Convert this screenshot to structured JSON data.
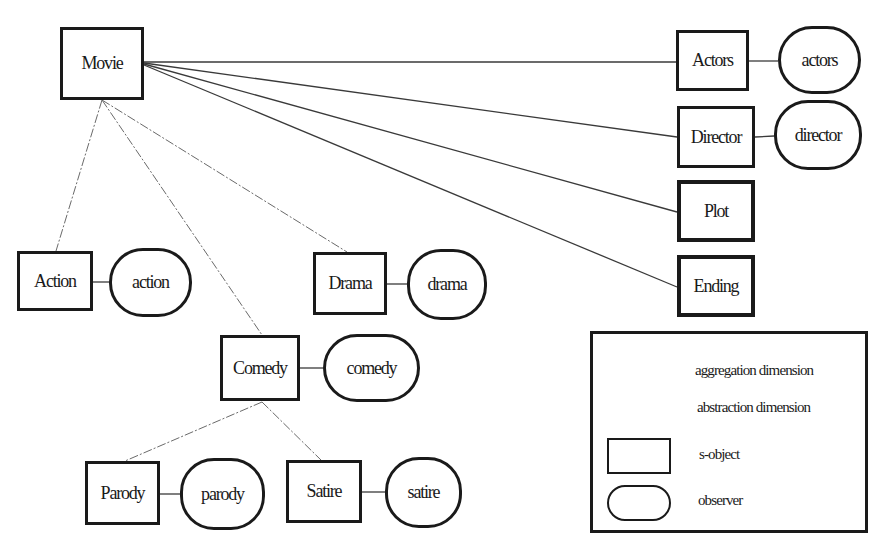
{
  "diagram": {
    "nodes": {
      "movie": {
        "label": "Movie",
        "kind": "s-object"
      },
      "actors": {
        "label": "Actors",
        "kind": "s-object"
      },
      "director": {
        "label": "Director",
        "kind": "s-object"
      },
      "plot": {
        "label": "Plot",
        "kind": "s-object"
      },
      "ending": {
        "label": "Ending",
        "kind": "s-object"
      },
      "action": {
        "label": "Action",
        "kind": "s-object"
      },
      "drama": {
        "label": "Drama",
        "kind": "s-object"
      },
      "comedy": {
        "label": "Comedy",
        "kind": "s-object"
      },
      "parody": {
        "label": "Parody",
        "kind": "s-object"
      },
      "satire": {
        "label": "Satire",
        "kind": "s-object"
      },
      "actors_obs": {
        "label": "actors",
        "kind": "observer"
      },
      "director_obs": {
        "label": "director",
        "kind": "observer"
      },
      "action_obs": {
        "label": "action",
        "kind": "observer"
      },
      "drama_obs": {
        "label": "drama",
        "kind": "observer"
      },
      "comedy_obs": {
        "label": "comedy",
        "kind": "observer"
      },
      "parody_obs": {
        "label": "parody",
        "kind": "observer"
      },
      "satire_obs": {
        "label": "satire",
        "kind": "observer"
      }
    },
    "edges": [
      {
        "from": "Movie",
        "to": "Actors",
        "type": "aggregation"
      },
      {
        "from": "Movie",
        "to": "Director",
        "type": "aggregation"
      },
      {
        "from": "Movie",
        "to": "Plot",
        "type": "aggregation"
      },
      {
        "from": "Movie",
        "to": "Ending",
        "type": "aggregation"
      },
      {
        "from": "Movie",
        "to": "Action",
        "type": "abstraction"
      },
      {
        "from": "Movie",
        "to": "Comedy",
        "type": "abstraction"
      },
      {
        "from": "Movie",
        "to": "Drama",
        "type": "abstraction"
      },
      {
        "from": "Comedy",
        "to": "Parody",
        "type": "abstraction"
      },
      {
        "from": "Comedy",
        "to": "Satire",
        "type": "abstraction"
      },
      {
        "from": "Actors",
        "to": "actors",
        "type": "observer-link"
      },
      {
        "from": "Director",
        "to": "director",
        "type": "observer-link"
      },
      {
        "from": "Action",
        "to": "action",
        "type": "observer-link"
      },
      {
        "from": "Drama",
        "to": "drama",
        "type": "observer-link"
      },
      {
        "from": "Comedy",
        "to": "comedy",
        "type": "observer-link"
      },
      {
        "from": "Parody",
        "to": "parody",
        "type": "observer-link"
      },
      {
        "from": "Satire",
        "to": "satire",
        "type": "observer-link"
      }
    ]
  },
  "legend": {
    "aggregation": "aggregation dimension",
    "abstraction": "abstraction dimension",
    "s_object": "s-object",
    "observer": "observer"
  },
  "colors": {
    "ink": "#1a1a1a",
    "aggregation_line": "#3a3a3a",
    "abstraction_line": "#6a6a6a",
    "background": "#ffffff"
  }
}
